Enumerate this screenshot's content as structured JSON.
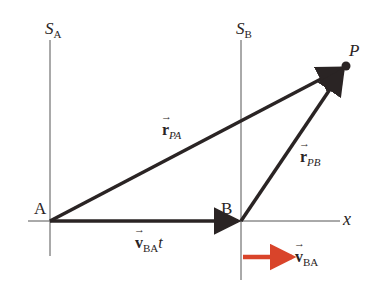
{
  "diagram": {
    "frames": [
      {
        "name": "S",
        "sub": "A"
      },
      {
        "name": "S",
        "sub": "B"
      }
    ],
    "points": {
      "A": "A",
      "B": "B",
      "P": "P"
    },
    "axis_label": "x",
    "vectors": {
      "r_PA": {
        "symbol": "r",
        "sub": "PA"
      },
      "r_PB": {
        "symbol": "r",
        "sub": "PB"
      },
      "v_BA_t": {
        "symbol": "v",
        "sub": "BA",
        "suffix": "t"
      },
      "v_BA": {
        "symbol": "v",
        "sub": "BA"
      }
    },
    "colors": {
      "line": "#2a2424",
      "velocity_arrow": "#d9442a",
      "thin_line": "#555555"
    }
  }
}
